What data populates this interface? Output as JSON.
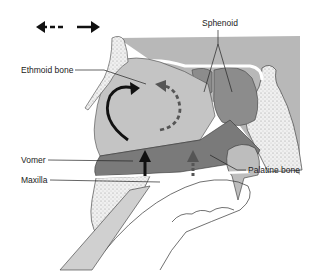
{
  "figure": {
    "type": "anatomical-diagram",
    "colors": {
      "background": "#ffffff",
      "cranial_base": "#b8b8b8",
      "nasal_cavity_light": "#c4c4c4",
      "vomer_dark": "#7a7a7a",
      "sphenoid_sinus": "#8c8c8c",
      "palate_light": "#d0d0d0",
      "stipple_bone": "#e8e8e8",
      "outline": "#333333",
      "arrow_solid": "#111111",
      "arrow_dashed": "#555555"
    }
  },
  "legend": {
    "direction_arrows": {
      "left": "dashed-arrow-left",
      "right": "solid-arrow-right"
    }
  },
  "labels": {
    "sphenoid": "Sphenoid",
    "ethmoid": "Ethmoid bone",
    "vomer": "Vomer",
    "maxilla": "Maxilla",
    "palatine": "Palatine bone"
  },
  "arrows": {
    "curved_solid": "counter-clockwise solid rotation arrow",
    "curved_dashed": "clockwise dashed rotation arrow",
    "up_solid": "solid upward arrow",
    "up_dashed": "dashed upward arrow"
  }
}
